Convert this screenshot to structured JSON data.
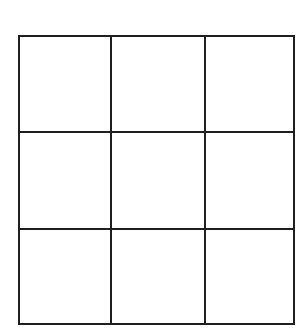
{
  "board": {
    "rows": 3,
    "cols": 3,
    "line_color": "#1f1f1f",
    "background": "#ffffff",
    "cells": [
      [
        "",
        "",
        ""
      ],
      [
        "",
        "",
        ""
      ],
      [
        "",
        "",
        ""
      ]
    ]
  }
}
